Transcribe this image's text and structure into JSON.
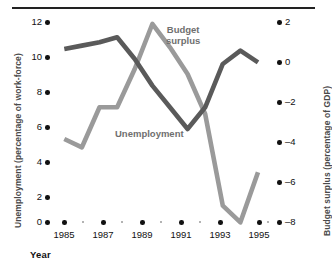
{
  "chart_data": {
    "type": "line",
    "title": "",
    "xlabel": "Year",
    "ylabel": "Unemployment (percentage of work-force)",
    "y2label": "Budget surplus (percentage of GDP)",
    "x": [
      1985,
      1986,
      1987,
      1988,
      1989,
      1990,
      1991,
      1992,
      1993,
      1994,
      1995,
      1996
    ],
    "xlim": [
      1985,
      1996
    ],
    "ylim": [
      0,
      12
    ],
    "y2lim": [
      -8,
      2
    ],
    "grid": false,
    "legend_position": "inline-annotations",
    "xticks_major": [
      1985,
      1987,
      1989,
      1991,
      1993,
      1995
    ],
    "xticks_major_labels": [
      "1985",
      "1987",
      "1989",
      "1991",
      "1993",
      "1995"
    ],
    "xticks_minor": [
      1986,
      1988,
      1990,
      1992,
      1994,
      1996
    ],
    "yticks": [
      0,
      2,
      4,
      6,
      8,
      10,
      12
    ],
    "ytick_labels": [
      "0",
      "2",
      "4",
      "6",
      "8",
      "10",
      "12"
    ],
    "y2ticks": [
      -8,
      -6,
      -4,
      -2,
      0,
      2
    ],
    "y2tick_labels": [
      "–8",
      "–6",
      "–4",
      "–2",
      "0",
      "2"
    ],
    "series": [
      {
        "name": "Unemployment",
        "axis": "left",
        "color": "#5a5a5a",
        "units": "percentage of work-force",
        "values": [
          10.4,
          10.6,
          10.8,
          11.1,
          9.8,
          8.2,
          6.9,
          5.6,
          6.9,
          9.5,
          10.3,
          9.6
        ]
      },
      {
        "name": "Budget surplus",
        "axis": "right",
        "color": "#9a9a9a",
        "units": "percentage of GDP",
        "values_left_scale": [
          5.0,
          4.5,
          6.9,
          6.9,
          9.2,
          11.9,
          10.5,
          8.9,
          6.5,
          1.0,
          0.0,
          3.0
        ],
        "values": [
          -3.8,
          -4.2,
          -2.2,
          -2.2,
          -0.7,
          1.6,
          0.4,
          -0.9,
          -2.9,
          -7.4,
          -8.0,
          -5.5
        ]
      }
    ],
    "annotations": [
      {
        "text": "Budget surplus",
        "series": "Budget surplus"
      },
      {
        "text": "Unemployment",
        "series": "Unemployment"
      }
    ]
  },
  "labels": {
    "y_left_title": "Unemployment (percentage of work-force)",
    "y_right_title": "Budget surplus (percentage of GDP)",
    "x_title": "Year",
    "budget_line1": "Budget",
    "budget_line2": "surplus",
    "unemployment": "Unemployment"
  },
  "colors": {
    "unemployment_line": "#5a5a5a",
    "budget_line": "#9a9a9a",
    "tick_dot": "#111111",
    "minor_dot": "#9a9a9a",
    "rule": "#222222",
    "axis_title": "#4a4a4a"
  }
}
